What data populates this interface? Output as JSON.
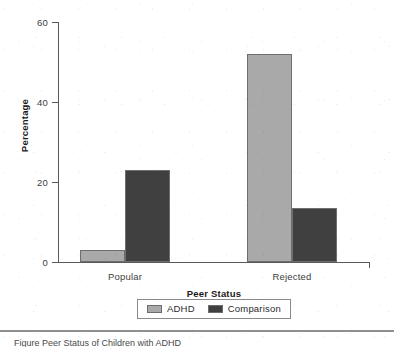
{
  "chart_data": {
    "type": "bar",
    "title": "",
    "xlabel": "Peer Status",
    "ylabel": "Percentage",
    "categories": [
      "Popular",
      "Rejected"
    ],
    "series": [
      {
        "name": "ADHD",
        "color": "#a9a9a9",
        "values": [
          3,
          52
        ]
      },
      {
        "name": "Comparison",
        "color": "#404040",
        "values": [
          23,
          13.5
        ]
      }
    ],
    "ylim": [
      0,
      60
    ],
    "yticks": [
      0,
      20,
      40,
      60
    ],
    "ytick_labels": [
      "0",
      "20",
      "40",
      "60"
    ],
    "grid": false,
    "legend_position": "bottom-center",
    "legend_boxed": true
  },
  "axes": {
    "y_title": "Percentage",
    "x_title": "Peer Status",
    "y_tick_labels": [
      "60",
      "40",
      "20",
      "0"
    ],
    "x_tick_labels": [
      "Popular",
      "Rejected"
    ]
  },
  "legend": {
    "entries": [
      {
        "label": "ADHD",
        "color": "#a9a9a9"
      },
      {
        "label": "Comparison",
        "color": "#404040"
      }
    ]
  },
  "footer": {
    "caption": "Figure   Peer Status of Children with ADHD"
  },
  "colors": {
    "adhd": "#a9a9a9",
    "comparison": "#404040",
    "axis": "#595959",
    "text": "#3d3d3d",
    "bar_outline": "#6e6e6e"
  }
}
